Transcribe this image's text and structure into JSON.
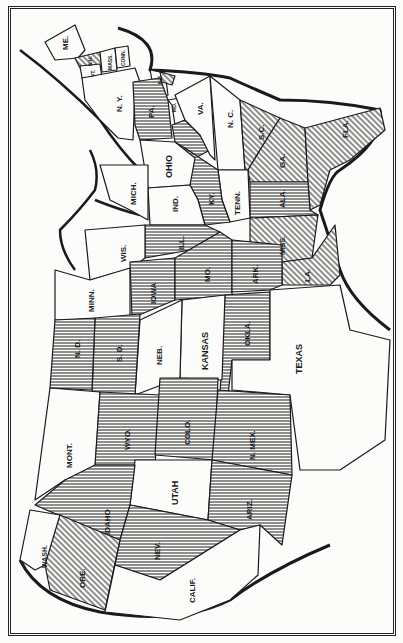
{
  "map": {
    "orientation": "rotated-90-clockwise",
    "shading_styles": {
      "horizontal": "horizontal-line shading",
      "diagonal": "diagonal hatching",
      "blank": "unshaded"
    },
    "colors": {
      "ink": "#1a1a1a",
      "paper": "#fcfcfa"
    },
    "states": [
      {
        "id": "me",
        "label": "ME.",
        "shading": "blank"
      },
      {
        "id": "vt",
        "label": "VT.",
        "shading": "blank"
      },
      {
        "id": "nh",
        "label": "N.H.",
        "shading": "diagonal"
      },
      {
        "id": "mass",
        "label": "MASS.",
        "shading": "blank"
      },
      {
        "id": "conn",
        "label": "CONN.",
        "shading": "blank"
      },
      {
        "id": "ri",
        "label": "R.I.",
        "shading": "blank"
      },
      {
        "id": "ny",
        "label": "N. Y.",
        "shading": "blank"
      },
      {
        "id": "nj",
        "label": "N.J.",
        "shading": "blank"
      },
      {
        "id": "del",
        "label": "DEL.",
        "shading": "diagonal"
      },
      {
        "id": "md",
        "label": "MD.",
        "shading": "blank"
      },
      {
        "id": "pa",
        "label": "PA.",
        "shading": "horizontal"
      },
      {
        "id": "wva",
        "label": "W.VA.",
        "shading": "horizontal"
      },
      {
        "id": "va",
        "label": "VA.",
        "shading": "blank"
      },
      {
        "id": "nc",
        "label": "N. C.",
        "shading": "blank"
      },
      {
        "id": "sc",
        "label": "S.C.",
        "shading": "diagonal"
      },
      {
        "id": "ga",
        "label": "GA.",
        "shading": "diagonal"
      },
      {
        "id": "fla",
        "label": "FLA.",
        "shading": "diagonal"
      },
      {
        "id": "ala",
        "label": "ALA.",
        "shading": "horizontal"
      },
      {
        "id": "miss",
        "label": "MISS.",
        "shading": "diagonal"
      },
      {
        "id": "la",
        "label": "LA.",
        "shading": "diagonal"
      },
      {
        "id": "tenn",
        "label": "TENN.",
        "shading": "blank"
      },
      {
        "id": "ky",
        "label": "KY.",
        "shading": "horizontal"
      },
      {
        "id": "ohio",
        "label": "OHIO",
        "shading": "blank"
      },
      {
        "id": "ind",
        "label": "IND.",
        "shading": "blank"
      },
      {
        "id": "mich",
        "label": "MICH.",
        "shading": "blank"
      },
      {
        "id": "ill",
        "label": "ILL.",
        "shading": "horizontal"
      },
      {
        "id": "wis",
        "label": "WIS.",
        "shading": "blank"
      },
      {
        "id": "minn",
        "label": "MINN.",
        "shading": "blank"
      },
      {
        "id": "iowa",
        "label": "IOWA",
        "shading": "horizontal"
      },
      {
        "id": "mo",
        "label": "MO.",
        "shading": "horizontal"
      },
      {
        "id": "ark",
        "label": "ARK.",
        "shading": "horizontal"
      },
      {
        "id": "okla",
        "label": "OKLA.",
        "shading": "horizontal"
      },
      {
        "id": "texas",
        "label": "TEXAS",
        "shading": "blank"
      },
      {
        "id": "kansas",
        "label": "KANSAS",
        "shading": "blank"
      },
      {
        "id": "neb",
        "label": "NEB.",
        "shading": "blank"
      },
      {
        "id": "sd",
        "label": "S. D.",
        "shading": "horizontal"
      },
      {
        "id": "nd",
        "label": "N. D.",
        "shading": "horizontal"
      },
      {
        "id": "mont",
        "label": "MONT.",
        "shading": "blank"
      },
      {
        "id": "wyo",
        "label": "WYO.",
        "shading": "horizontal"
      },
      {
        "id": "colo",
        "label": "COLO.",
        "shading": "horizontal"
      },
      {
        "id": "nmex",
        "label": "N. MEX.",
        "shading": "horizontal"
      },
      {
        "id": "utah",
        "label": "UTAH",
        "shading": "blank"
      },
      {
        "id": "ariz",
        "label": "ARIZ.",
        "shading": "horizontal"
      },
      {
        "id": "idaho",
        "label": "IDAHO",
        "shading": "horizontal"
      },
      {
        "id": "nev",
        "label": "NEV.",
        "shading": "horizontal"
      },
      {
        "id": "wash",
        "label": "WASH.",
        "shading": "blank"
      },
      {
        "id": "ore",
        "label": "ORE.",
        "shading": "diagonal"
      },
      {
        "id": "calif",
        "label": "CALIF.",
        "shading": "blank"
      }
    ]
  }
}
